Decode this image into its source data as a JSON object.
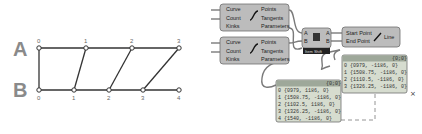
{
  "diagram": {
    "rows": [
      {
        "label": "A",
        "indices": [
          "0",
          "1",
          "2",
          "3"
        ]
      },
      {
        "label": "B",
        "indices": [
          "0",
          "1",
          "2",
          "3",
          "4"
        ]
      }
    ]
  },
  "components": {
    "divide_curve_1": {
      "inputs": [
        "Curve",
        "Count",
        "Kinks"
      ],
      "outputs": [
        "Points",
        "Tangents",
        "Parameters"
      ]
    },
    "divide_curve_2": {
      "inputs": [
        "Curve",
        "Count",
        "Kinks"
      ],
      "outputs": [
        "Points",
        "Tangents",
        "Parameters"
      ]
    },
    "shift_list": {
      "inputs": [
        "A",
        "B"
      ],
      "outputs": [
        "A",
        "B"
      ],
      "label": "Item Shift"
    },
    "line": {
      "inputs": [
        "Start Point",
        "End Point"
      ],
      "output": "Line"
    }
  },
  "panels": {
    "panel_1": {
      "header": "{0;0}",
      "rows": [
        "0 {0979, 1186, 0}",
        "1 {1508.75, -1186, 0}",
        "2 {1102.5, 1186, 0}",
        "3 {1326.25, -1186, 0}",
        "4 {1540, -1186, 0}"
      ]
    },
    "panel_2": {
      "header": "{0;0}",
      "rows": [
        "0 {0979, -1186, 0}",
        "1 {1508.75, -1186, 0}",
        "2 {1110.5, -1186, 0}",
        "3 {1326.25, -1186, 0}"
      ]
    }
  }
}
